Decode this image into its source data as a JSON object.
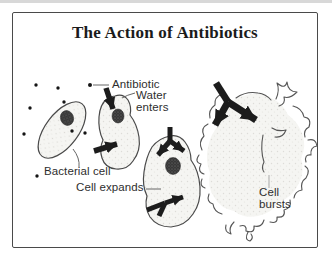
{
  "title": "The Action of Antibiotics",
  "labels": {
    "antibiotic": "Antibiotic",
    "water_enters": "Water\nenters",
    "bacterial_cell": "Bacterial cell",
    "cell_expands": "Cell expands",
    "cell_bursts": "Cell\nbursts"
  },
  "stages": [
    "Bacterial cell",
    "Water enters",
    "Cell expands",
    "Cell bursts"
  ],
  "colors": {
    "outline": "#4a4a4a",
    "arrow": "#1c1c1c",
    "cell_fill": "#f5f5f2",
    "nucleoid": "#383838",
    "text": "#2e2e2e",
    "background": "#ffffff"
  }
}
